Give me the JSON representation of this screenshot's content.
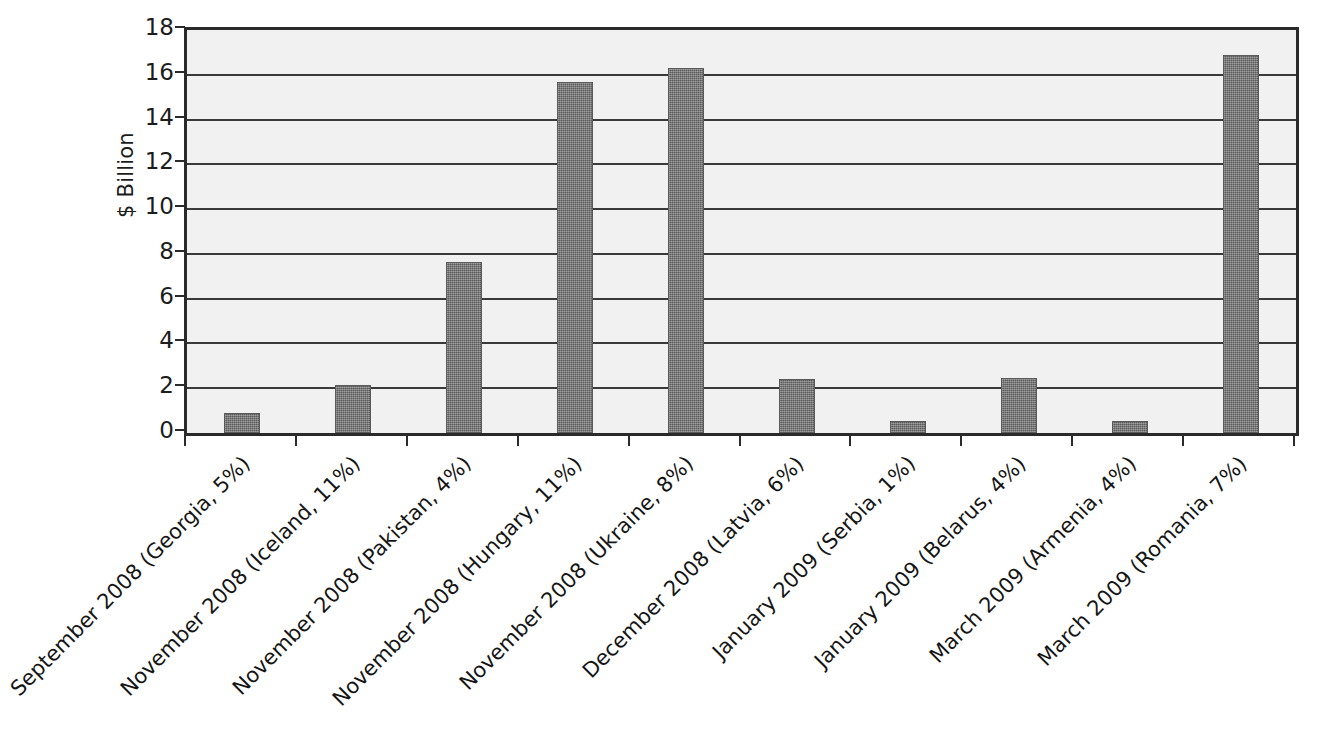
{
  "chart_data": {
    "type": "bar",
    "title": "",
    "subtitle": "",
    "xlabel": "",
    "ylabel": "$ Billion",
    "ylim": [
      0,
      18
    ],
    "ytick_step": 2,
    "yticks": [
      "0",
      "2",
      "4",
      "6",
      "8",
      "10",
      "12",
      "14",
      "16",
      "18"
    ],
    "grid": true,
    "legend": "none",
    "bar_color": "#6e6e6e",
    "plot_background": "#f1f1f1",
    "axis_color": "#2a2a2a",
    "categories": [
      "September 2008 (Georgia, 5%)",
      "November 2008 (Iceland, 11%)",
      "November 2008 (Pakistan, 4%)",
      "November 2008 (Hungary, 11%)",
      "November 2008 (Ukraine, 8%)",
      "December 2008 (Latvia, 6%)",
      "January 2009 (Serbia, 1%)",
      "January 2009 (Belarus, 4%)",
      "March 2009 (Armenia, 4%)",
      "March 2009 (Romania, 7%)"
    ],
    "values": [
      0.9,
      2.15,
      7.65,
      15.7,
      16.3,
      2.4,
      0.55,
      2.45,
      0.55,
      16.9
    ]
  }
}
